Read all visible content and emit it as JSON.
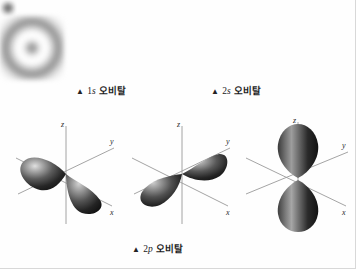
{
  "figure": {
    "background_color": "#fefefe",
    "ink_color": "#1c1c1c"
  },
  "captions": {
    "s1": {
      "marker": "▲",
      "quantum": "1s",
      "shell": "1",
      "subshell": "s",
      "label": "오비탈",
      "full": "▲ 1s 오비탈"
    },
    "s2": {
      "marker": "▲",
      "quantum": "2s",
      "shell": "2",
      "subshell": "s",
      "label": "오비탈",
      "full": "▲ 2s 오비탈"
    },
    "p2": {
      "marker": "▲",
      "quantum": "2p",
      "shell": "2",
      "subshell": "p",
      "label": "오비탈",
      "full": "▲ 2p 오비탈"
    }
  },
  "orbitals": {
    "s1": {
      "name": "1s",
      "type": "spherical-cloud",
      "nodes": 0,
      "relative_size": "small",
      "description": "작은 구형 전자 구름"
    },
    "s2": {
      "name": "2s",
      "type": "spherical-cloud",
      "nodes": 1,
      "relative_size": "large",
      "description": "마디가 하나 있는 큰 구형 전자 구름"
    },
    "p": [
      {
        "name": "2px",
        "axis": "x",
        "lobes": 2,
        "orientation": "x축 방향"
      },
      {
        "name": "2py",
        "axis": "y",
        "lobes": 2,
        "orientation": "y축 방향"
      },
      {
        "name": "2pz",
        "axis": "z",
        "lobes": 2,
        "orientation": "z축 방향"
      }
    ]
  },
  "axes": {
    "x_label": "x",
    "y_label": "y",
    "z_label": "z"
  },
  "colors": {
    "lobe_dark": "#1d1d1d",
    "lobe_mid": "#5a5a5a",
    "lobe_highlight": "#d7d7d7",
    "axis": "#9a9a9a",
    "cloud": "#7e7e7e"
  }
}
